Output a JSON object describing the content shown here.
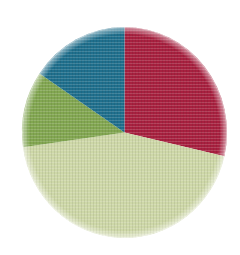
{
  "chart_data": {
    "type": "pie",
    "title": "",
    "subtitle": "",
    "xlabel": "",
    "ylabel": "",
    "grid": false,
    "legend": "none",
    "labels_shown": false,
    "start_angle_deg": 0,
    "direction": "clockwise",
    "categories": [
      "Crimson segment",
      "Pale sage segment",
      "Olive green segment",
      "Teal blue segment"
    ],
    "values": [
      28.6,
      44.2,
      11.7,
      15.5
    ],
    "units": "percent",
    "colors": [
      "#a81f3e",
      "#cfd9a8",
      "#82a750",
      "#1e6f8d"
    ],
    "segments": [
      {
        "name": "Crimson segment",
        "value": 28.6,
        "color": "#a81f3e",
        "start_angle_deg": 0,
        "end_angle_deg": 103
      },
      {
        "name": "Pale sage segment",
        "value": 44.2,
        "color": "#cfd9a8",
        "start_angle_deg": 103,
        "end_angle_deg": 262
      },
      {
        "name": "Olive green segment",
        "value": 11.7,
        "color": "#82a750",
        "start_angle_deg": 262,
        "end_angle_deg": 304
      },
      {
        "name": "Teal blue segment",
        "value": 15.5,
        "color": "#1e6f8d",
        "start_angle_deg": 304,
        "end_angle_deg": 360
      }
    ]
  },
  "canvas": {
    "background_color": "#ffffff",
    "width": 240,
    "height": 255
  },
  "geometry": {
    "center_x": 124.5,
    "center_y": 132.5,
    "radius_x": 102.5,
    "radius_y": 105.5
  }
}
